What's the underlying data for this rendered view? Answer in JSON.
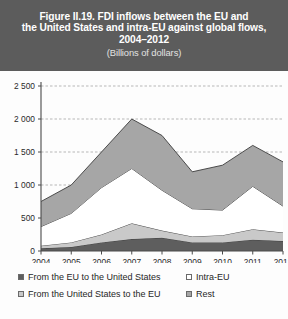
{
  "figure": {
    "title_lines": [
      "Figure II.19. FDI inflows between the EU and",
      "the United States and intra-EU against global flows,",
      "2004–2012"
    ],
    "subtitle": "(Billions of dollars)",
    "banner_color": "#5c5c5c",
    "title_color": "#ffffff"
  },
  "legend": {
    "entries": [
      {
        "label": "From the EU to the United States",
        "color": "#5e5e5e"
      },
      {
        "label": "Intra-EU",
        "color": "#ffffff"
      },
      {
        "label": "From the United States to the EU",
        "color": "#c9c9c9"
      },
      {
        "label": "Rest",
        "color": "#a6a6a6"
      }
    ]
  },
  "chart_data": {
    "type": "area",
    "stacked": true,
    "title": "Figure II.19. FDI inflows between the EU and the United States and intra-EU against global flows, 2004–2012",
    "subtitle": "(Billions of dollars)",
    "xlabel": "",
    "ylabel": "",
    "unit": "Billions of dollars",
    "grid": true,
    "legend_position": "bottom",
    "categories": [
      "2004",
      "2005",
      "2006",
      "2007",
      "2008",
      "2009",
      "2010",
      "2011",
      "2012"
    ],
    "x": [
      2004,
      2005,
      2006,
      2007,
      2008,
      2009,
      2010,
      2011,
      2012
    ],
    "ylim": [
      0,
      2500
    ],
    "yticks": [
      0,
      500,
      1000,
      1500,
      2000,
      2500
    ],
    "ytick_labels": [
      "0",
      "500",
      "1 000",
      "1 500",
      "2 000",
      "2 500"
    ],
    "series": [
      {
        "name": "From the EU to the United States",
        "color": "#5e5e5e",
        "values": [
          40,
          60,
          130,
          180,
          200,
          130,
          130,
          170,
          150
        ]
      },
      {
        "name": "From the United States to the EU",
        "color": "#c9c9c9",
        "values": [
          40,
          70,
          120,
          240,
          110,
          90,
          110,
          160,
          130
        ]
      },
      {
        "name": "Intra-EU",
        "color": "#ffffff",
        "values": [
          290,
          440,
          710,
          830,
          610,
          420,
          380,
          650,
          400
        ]
      },
      {
        "name": "Rest",
        "color": "#a6a6a6",
        "values": [
          380,
          430,
          540,
          750,
          830,
          560,
          680,
          620,
          670
        ]
      }
    ],
    "totals": [
      750,
      1000,
      1500,
      2000,
      1750,
      1200,
      1300,
      1600,
      1350
    ]
  }
}
